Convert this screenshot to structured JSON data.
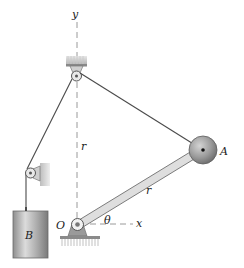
{
  "diagram": {
    "labels": {
      "y_axis": "y",
      "x_axis": "x",
      "vertical_length": "r",
      "rod_length": "r",
      "angle": "θ",
      "pivot": "O",
      "sphere": "A",
      "block": "B"
    },
    "colors": {
      "rope": "#4a4a4a",
      "axis_dash": "#9a9a9a",
      "rod_fill": "#d8d8d8",
      "rod_edge": "#707070",
      "sphere_fill": "#9b9b9b",
      "block_fill": "#b5b5b5",
      "hatch": "#8a8a8a"
    }
  }
}
